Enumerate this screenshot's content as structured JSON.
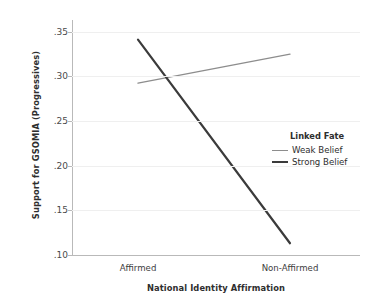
{
  "chart_data": {
    "type": "line",
    "title": "",
    "xlabel": "National Identity Affirmation",
    "ylabel": "Support for GSOMIA (Progressives)",
    "categories": [
      "Affirmed",
      "Non-Affirmed"
    ],
    "xticklabels": [
      "Affirmed",
      "Non-Affirmed"
    ],
    "yticklabels": [
      ".35",
      ".30",
      ".25",
      ".20",
      ".15",
      ".10"
    ],
    "ytickvalues": [
      0.35,
      0.3,
      0.25,
      0.2,
      0.15,
      0.1
    ],
    "ylim": [
      0.1,
      0.3597
    ],
    "xlim": [
      0,
      1
    ],
    "grid": "horizontal",
    "legend_position": "center-right",
    "legend_title": "Linked Fate",
    "series": [
      {
        "name": "Weak Belief",
        "color": "#8d8d8d",
        "linewidth": 1.4,
        "x": [
          "Affirmed",
          "Non-Affirmed"
        ],
        "values": [
          0.29,
          0.322
        ]
      },
      {
        "name": "Strong Belief",
        "color": "#3b3b3b",
        "linewidth": 2.2,
        "x": [
          "Affirmed",
          "Non-Affirmed"
        ],
        "values": [
          0.338,
          0.113
        ]
      }
    ],
    "colors": {
      "background": "#ffffff",
      "gridline": "#efefef",
      "axis": "#b9b9b9",
      "text": "#3a3a3a",
      "weak_belief": "#8d8d8d",
      "strong_belief": "#3b3b3b"
    }
  },
  "axes": {
    "y_title": "Support for GSOMIA (Progressives)",
    "x_title": "National Identity Affirmation",
    "yticks": [
      {
        "label": ".35",
        "value": 0.35
      },
      {
        "label": ".30",
        "value": 0.3
      },
      {
        "label": ".25",
        "value": 0.25
      },
      {
        "label": ".20",
        "value": 0.2
      },
      {
        "label": ".15",
        "value": 0.15
      },
      {
        "label": ".10",
        "value": 0.1
      }
    ],
    "xticks": [
      {
        "label": "Affirmed"
      },
      {
        "label": "Non-Affirmed"
      }
    ]
  },
  "legend": {
    "title": "Linked Fate",
    "items": [
      {
        "label": "Weak Belief",
        "color": "#8d8d8d"
      },
      {
        "label": "Strong Belief",
        "color": "#3b3b3b"
      }
    ]
  }
}
